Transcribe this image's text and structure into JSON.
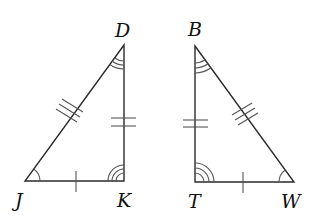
{
  "diagram": {
    "type": "congruent-triangles",
    "colors": {
      "stroke": "#2b2b2b",
      "marks": "#555555",
      "label": "#111111"
    },
    "triangles": [
      {
        "name": "triangle-DJK",
        "vertices": {
          "D": {
            "label": "D",
            "angle_marks": 2
          },
          "J": {
            "label": "J",
            "angle_marks": 1
          },
          "K": {
            "label": "K",
            "angle_marks": 3
          }
        },
        "sides": {
          "JD": {
            "tick_marks": 3
          },
          "DK": {
            "tick_marks": 2
          },
          "JK": {
            "tick_marks": 1
          }
        }
      },
      {
        "name": "triangle-BTW",
        "vertices": {
          "B": {
            "label": "B",
            "angle_marks": 2
          },
          "T": {
            "label": "T",
            "angle_marks": 3
          },
          "W": {
            "label": "W",
            "angle_marks": 1
          }
        },
        "sides": {
          "BW": {
            "tick_marks": 3
          },
          "BT": {
            "tick_marks": 2
          },
          "TW": {
            "tick_marks": 1
          }
        }
      }
    ],
    "labels": {
      "D": "D",
      "J": "J",
      "K": "K",
      "B": "B",
      "T": "T",
      "W": "W"
    }
  }
}
